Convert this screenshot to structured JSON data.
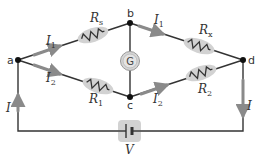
{
  "diagram": {
    "colors": {
      "wire": "#333333",
      "arrow": "#8a8a8a",
      "highlight": "#d2d2d2",
      "node": "#111111",
      "text": "#333333"
    },
    "nodes": [
      {
        "id": "a",
        "label": "a"
      },
      {
        "id": "b",
        "label": "b"
      },
      {
        "id": "c",
        "label": "c"
      },
      {
        "id": "d",
        "label": "d"
      }
    ],
    "components": {
      "Rs": {
        "symbol": "R",
        "sub": "s",
        "branch": "a-b"
      },
      "Rx": {
        "symbol": "R",
        "sub": "x",
        "branch": "b-d"
      },
      "R1": {
        "symbol": "R",
        "sub": "1",
        "branch": "a-c"
      },
      "R2": {
        "symbol": "R",
        "sub": "2",
        "branch": "c-d"
      },
      "galvanometer": {
        "label": "G",
        "branch": "b-c"
      },
      "battery": {
        "label": "V",
        "branch": "bottom"
      }
    },
    "currents": {
      "I1_ab": {
        "symbol": "I",
        "sub": "1"
      },
      "I1_bd": {
        "symbol": "I",
        "sub": "1"
      },
      "I2_ac": {
        "symbol": "I",
        "sub": "2"
      },
      "I2_cd": {
        "symbol": "I",
        "sub": "2"
      },
      "I_left": {
        "symbol": "I",
        "sub": ""
      },
      "I_right": {
        "symbol": "I",
        "sub": ""
      }
    }
  }
}
